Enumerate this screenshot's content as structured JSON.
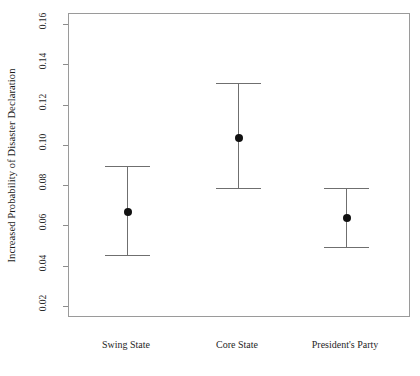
{
  "chart_data": {
    "type": "scatter",
    "title": "",
    "xlabel": "",
    "ylabel": "Increased Probability of Disaster Declaration",
    "categories": [
      "Swing State",
      "Core State",
      "President's Party"
    ],
    "values": [
      0.067,
      0.104,
      0.064
    ],
    "ci_lower": [
      0.046,
      0.079,
      0.05
    ],
    "ci_upper": [
      0.09,
      0.131,
      0.079
    ],
    "ylim": [
      0.0145,
      0.1655
    ],
    "yticks": [
      0.02,
      0.04,
      0.06,
      0.08,
      0.1,
      0.12,
      0.14,
      0.16
    ],
    "ytick_labels": [
      "0.02",
      "0.04",
      "0.06",
      "0.08",
      "0.10",
      "0.12",
      "0.14",
      "0.16"
    ],
    "grid": false,
    "legend": null,
    "series": [
      {
        "name": "Estimate with 95% confidence interval",
        "points": [
          {
            "category": "Swing State",
            "value": 0.067,
            "low": 0.046,
            "high": 0.09
          },
          {
            "category": "Core State",
            "value": 0.104,
            "low": 0.079,
            "high": 0.131
          },
          {
            "category": "President's Party",
            "value": 0.064,
            "low": 0.05,
            "high": 0.079
          }
        ]
      }
    ],
    "colors": {
      "point": "#111111",
      "errorbar": "#6f6f6f",
      "frame": "#9a9a9a",
      "background": "#ffffff",
      "text": "#1a1a1a"
    }
  }
}
